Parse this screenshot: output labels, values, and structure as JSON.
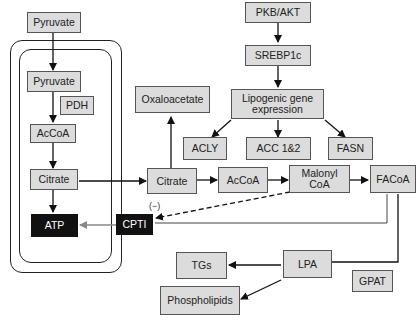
{
  "diagram": {
    "compartment": "mitochondrion (double membrane)",
    "nodes": {
      "pyruvate_cyto": "Pyruvate",
      "pyruvate_mito": "Pyruvate",
      "pdh": "PDH",
      "accoa_mito": "AcCoA",
      "citrate_mito": "Citrate",
      "atp": "ATP",
      "cpti": "CPTI",
      "pkb_akt": "PKB/AKT",
      "srebp1c": "SREBP1c",
      "lipogenic_line1": "Lipogenic gene",
      "lipogenic_line2": "expression",
      "oxaloacetate": "Oxaloacetate",
      "acly": "ACLY",
      "acc": "ACC 1&2",
      "fasn": "FASN",
      "citrate_cyto": "Citrate",
      "accoa_cyto": "AcCoA",
      "malonyl_line1": "Malonyl",
      "malonyl_line2": "CoA",
      "facoa": "FACoA",
      "lpa": "LPA",
      "gpat": "GPAT",
      "tgs": "TGs",
      "phospholipids": "Phospholipids"
    },
    "inhibition_label": "(−)",
    "edges": [
      {
        "from": "Pyruvate",
        "to": "Pyruvate (mito)",
        "style": "solid"
      },
      {
        "from": "Pyruvate (mito)",
        "to": "AcCoA (mito)",
        "style": "solid"
      },
      {
        "from": "AcCoA (mito)",
        "to": "Citrate (mito)",
        "style": "solid"
      },
      {
        "from": "Citrate (mito)",
        "to": "ATP",
        "style": "solid"
      },
      {
        "from": "Citrate (mito)",
        "to": "Citrate (cyto)",
        "style": "solid"
      },
      {
        "from": "Citrate (cyto)",
        "to": "Oxaloacetate",
        "style": "solid"
      },
      {
        "from": "Citrate (cyto)",
        "to": "AcCoA (cyto)",
        "style": "solid"
      },
      {
        "from": "AcCoA (cyto)",
        "to": "Malonyl CoA",
        "style": "solid"
      },
      {
        "from": "Malonyl CoA",
        "to": "FACoA",
        "style": "solid"
      },
      {
        "from": "Malonyl CoA",
        "to": "CPTI",
        "style": "dashed",
        "label": "(−)"
      },
      {
        "from": "FACoA",
        "to": "CPTI",
        "style": "line"
      },
      {
        "from": "CPTI",
        "to": "ATP",
        "style": "gray"
      },
      {
        "from": "FACoA",
        "to": "LPA",
        "style": "solid"
      },
      {
        "from": "LPA",
        "to": "TGs",
        "style": "solid"
      },
      {
        "from": "LPA",
        "to": "Phospholipids",
        "style": "solid"
      },
      {
        "from": "PKB/AKT",
        "to": "SREBP1c",
        "style": "solid"
      },
      {
        "from": "SREBP1c",
        "to": "Lipogenic gene expression",
        "style": "solid"
      },
      {
        "from": "Lipogenic gene expression",
        "to": "ACLY",
        "style": "solid"
      },
      {
        "from": "Lipogenic gene expression",
        "to": "ACC 1&2",
        "style": "solid"
      },
      {
        "from": "Lipogenic gene expression",
        "to": "FASN",
        "style": "solid"
      }
    ],
    "colors": {
      "box_fill": "#dcdcdc",
      "box_border": "#555555",
      "dark_box": "#111111",
      "arrow": "#111111",
      "gray_arrow": "#888888"
    }
  }
}
